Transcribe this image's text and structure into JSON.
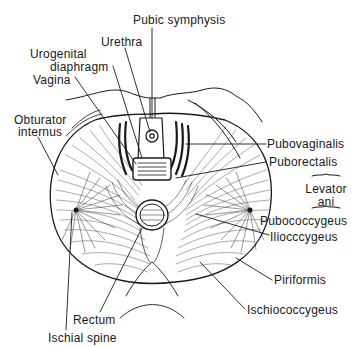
{
  "figure": {
    "colors": {
      "ink": "#1a1a1a",
      "background": "#ffffff"
    }
  },
  "labels": {
    "pubic_symphysis": "Pubic  symphysis",
    "urethra": "Urethra",
    "urogenital_line1": "Urogenital",
    "urogenital_line2": "diaphragm",
    "vagina": "Vagina",
    "obturator_line1": "Obturator",
    "obturator_line2": "internus",
    "pubovaginalis": "Pubovaginalis",
    "puborectalis": "Puborectalis",
    "levator_line1": "Levator",
    "levator_line2": "ani",
    "pubococcygeus": "Pubococcygeus",
    "iliococcygeus": "Iliocccygeus",
    "piriformis": "Piriformis",
    "ischiococcygeus": "Ischiococcygeus",
    "rectum": "Rectum",
    "ischial_spine": "Ischial  spine"
  },
  "brace_glyph": "~"
}
